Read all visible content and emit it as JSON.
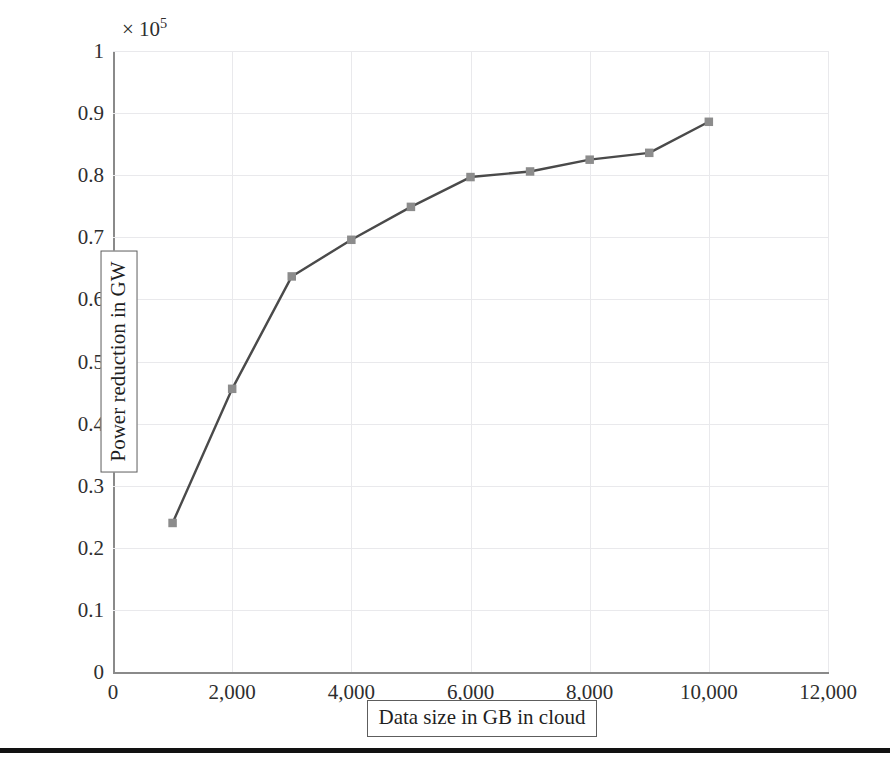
{
  "figure": {
    "axis_multiplier_prefix": "× 10",
    "axis_multiplier_exponent": "5",
    "x_axis_title": "Data size in GB in cloud",
    "y_axis_title": "Power reduction in GW",
    "line_color": "#4a4a4a",
    "marker_color": "#8c8c8c",
    "grid_color": "#e9e9ec",
    "axis_color": "#8a8a8a"
  },
  "chart_data": {
    "type": "line",
    "title": "",
    "xlabel": "Data size in GB in cloud",
    "ylabel": "Power reduction in GW",
    "y_multiplier": 100000,
    "y_multiplier_label": "× 10^5",
    "xlim": [
      0,
      12000
    ],
    "ylim": [
      0,
      1
    ],
    "grid": true,
    "legend": "none",
    "x_ticks": [
      "0",
      "2,000",
      "4,000",
      "6,000",
      "8,000",
      "10,000",
      "12,000"
    ],
    "x_tick_values": [
      0,
      2000,
      4000,
      6000,
      8000,
      10000,
      12000
    ],
    "y_ticks": [
      "0",
      "0.1",
      "0.2",
      "0.3",
      "0.4",
      "0.5",
      "0.6",
      "0.7",
      "0.8",
      "0.9",
      "1"
    ],
    "y_tick_values": [
      0,
      0.1,
      0.2,
      0.3,
      0.4,
      0.5,
      0.6,
      0.7,
      0.8,
      0.9,
      1
    ],
    "marker": "square",
    "series": [
      {
        "name": "Power reduction",
        "x": [
          1000,
          2000,
          3000,
          4000,
          5000,
          6000,
          7000,
          8000,
          9000,
          10000
        ],
        "values": [
          0.24,
          0.456,
          0.637,
          0.696,
          0.749,
          0.797,
          0.806,
          0.825,
          0.836,
          0.886
        ]
      }
    ]
  }
}
